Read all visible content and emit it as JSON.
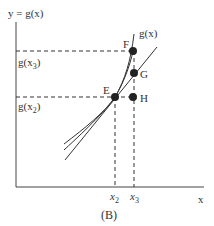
{
  "figure": {
    "panel_label": "(B)",
    "y_axis_label": "y = g(x)",
    "x_axis_label": "x",
    "curve_label": "g(x)",
    "y_ticks": [
      {
        "label_main": "g(x",
        "label_sub": "3",
        "label_end": ")",
        "y": 51
      },
      {
        "label_main": "g(x",
        "label_sub": "2",
        "label_end": ")",
        "y": 97
      }
    ],
    "x_ticks": [
      {
        "label_main": "x",
        "label_sub": "2",
        "x": 115
      },
      {
        "label_main": "x",
        "label_sub": "3",
        "x": 134
      }
    ],
    "points": [
      {
        "name": "E",
        "x": 115,
        "y": 97
      },
      {
        "name": "F",
        "x": 133,
        "y": 51
      },
      {
        "name": "G",
        "x": 134,
        "y": 73
      },
      {
        "name": "H",
        "x": 133,
        "y": 97
      }
    ],
    "colors": {
      "ink": "#333333",
      "background": "#ffffff"
    }
  }
}
